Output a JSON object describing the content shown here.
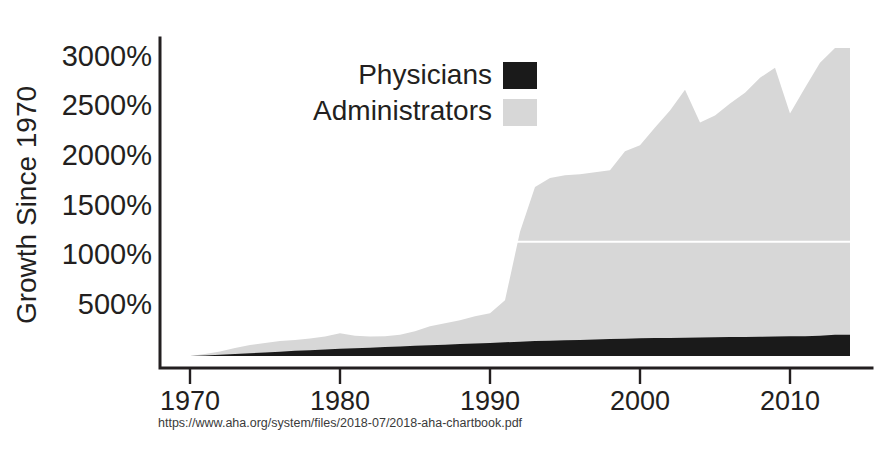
{
  "figure": {
    "background": "#ffffff",
    "width": 876,
    "height": 456
  },
  "source_note": "https://www.aha.org/system/files/2018-07/2018-aha-chartbook.pdf",
  "legend": {
    "position": "upper-center",
    "entries": [
      {
        "label": "Physicians",
        "color": "#1a1a1a",
        "swatch": "black-square"
      },
      {
        "label": "Administrators",
        "color": "#d7d7d7",
        "swatch": "light-gray-square"
      }
    ]
  },
  "axes": {
    "y_title": "Growth Since 1970",
    "y_ticks": [
      "500%",
      "1000%",
      "1500%",
      "2000%",
      "2500%",
      "3000%"
    ],
    "y_tick_values": [
      500,
      1000,
      1500,
      2000,
      2500,
      3000
    ],
    "x_ticks": [
      "1970",
      "1980",
      "1990",
      "2000",
      "2010"
    ],
    "x_tick_values": [
      1970,
      1980,
      1990,
      2000,
      2010
    ]
  },
  "chart_data": {
    "type": "area",
    "title": "",
    "subtitle": "",
    "xlabel": "",
    "ylabel": "Growth Since 1970",
    "xlim": [
      1970,
      2014
    ],
    "ylim": [
      0,
      3200
    ],
    "grid": false,
    "legend_position": "upper-center",
    "stacked": false,
    "annotations": [
      "white horizontal seam artifact across administrators area near 1150%"
    ],
    "x": [
      1970,
      1971,
      1972,
      1973,
      1974,
      1975,
      1976,
      1977,
      1978,
      1979,
      1980,
      1981,
      1982,
      1983,
      1984,
      1985,
      1986,
      1987,
      1988,
      1989,
      1990,
      1991,
      1992,
      1993,
      1994,
      1995,
      1996,
      1997,
      1998,
      1999,
      2000,
      2001,
      2002,
      2003,
      2004,
      2005,
      2006,
      2007,
      2008,
      2009,
      2010,
      2011,
      2012,
      2013,
      2014
    ],
    "series": [
      {
        "name": "Administrators",
        "color": "#d7d7d7",
        "values": [
          0,
          20,
          45,
          80,
          110,
          130,
          150,
          160,
          175,
          195,
          230,
          205,
          195,
          200,
          215,
          250,
          300,
          330,
          360,
          400,
          430,
          560,
          1250,
          1700,
          1790,
          1820,
          1830,
          1850,
          1870,
          2060,
          2120,
          2300,
          2470,
          2680,
          2350,
          2420,
          2540,
          2650,
          2800,
          2900,
          2440,
          2700,
          2950,
          3100,
          3100
        ]
      },
      {
        "name": "Physicians",
        "color": "#1a1a1a",
        "values": [
          0,
          5,
          12,
          20,
          28,
          36,
          44,
          52,
          58,
          65,
          72,
          78,
          84,
          90,
          96,
          102,
          108,
          114,
          120,
          126,
          132,
          138,
          144,
          150,
          154,
          158,
          162,
          166,
          170,
          174,
          178,
          180,
          182,
          184,
          186,
          188,
          190,
          192,
          194,
          196,
          198,
          200,
          205,
          215,
          215
        ]
      }
    ]
  }
}
